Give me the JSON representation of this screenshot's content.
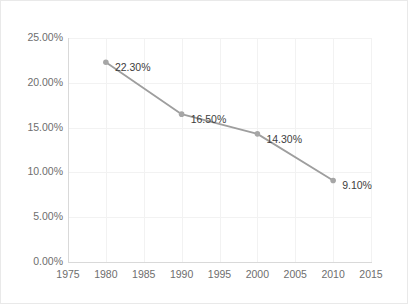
{
  "chart_data": {
    "type": "line",
    "title": "",
    "subtitle": "",
    "xlabel": "",
    "ylabel": "",
    "x": [
      1980,
      1990,
      2000,
      2010
    ],
    "values": [
      22.3,
      16.5,
      14.3,
      9.1
    ],
    "point_labels": [
      "22.30%",
      "16.50%",
      "14.30%",
      "9.10%"
    ],
    "series": [
      {
        "name": "",
        "values": [
          22.3,
          16.5,
          14.3,
          9.1
        ]
      }
    ],
    "xlim": [
      1975,
      2015
    ],
    "ylim": [
      0,
      25
    ],
    "x_tick_labels": [
      "1975",
      "1980",
      "1985",
      "1990",
      "1995",
      "2000",
      "2005",
      "2010",
      "2015"
    ],
    "x_tick_values": [
      1975,
      1980,
      1985,
      1990,
      1995,
      2000,
      2005,
      2010,
      2015
    ],
    "y_tick_labels": [
      "0.00%",
      "5.00%",
      "10.00%",
      "15.00%",
      "20.00%",
      "25.00%"
    ],
    "y_tick_values": [
      0,
      5,
      10,
      15,
      20,
      25
    ],
    "grid": true,
    "legend": "none",
    "colors": {
      "line": "#9e9e9e",
      "marker": "#a6a6a6",
      "grid": "#f2f2f2",
      "axis": "#d9d9d9",
      "tick_text": "#6e6e6e",
      "label_text": "#3d3d3d",
      "background": "#ffffff",
      "border": "#e9e9e9"
    }
  }
}
